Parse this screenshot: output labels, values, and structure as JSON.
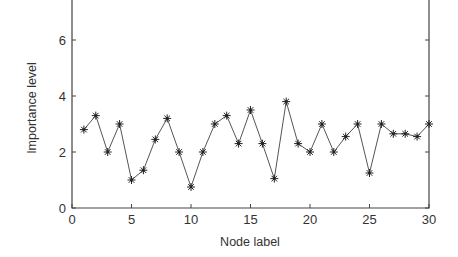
{
  "chart_data": {
    "type": "line",
    "title": "",
    "xlabel": "Node label",
    "ylabel": "Importance level",
    "xlim": [
      0,
      30
    ],
    "ylim": [
      0,
      7.4
    ],
    "xticks": [
      0,
      5,
      10,
      15,
      20,
      25,
      30
    ],
    "yticks": [
      0,
      2,
      4,
      6
    ],
    "grid": false,
    "legend": null,
    "marker": "asterisk",
    "series": [
      {
        "name": "Importance level",
        "x": [
          1,
          2,
          3,
          4,
          5,
          6,
          7,
          8,
          9,
          10,
          11,
          12,
          13,
          14,
          15,
          16,
          17,
          18,
          19,
          20,
          21,
          22,
          23,
          24,
          25,
          26,
          27,
          28,
          29,
          30
        ],
        "values": [
          2.8,
          3.3,
          2.0,
          3.0,
          1.0,
          1.35,
          2.45,
          3.2,
          2.0,
          0.75,
          2.0,
          3.0,
          3.3,
          2.3,
          3.5,
          2.3,
          1.05,
          3.8,
          2.3,
          2.0,
          3.0,
          2.0,
          2.55,
          3.0,
          1.25,
          3.0,
          2.65,
          2.65,
          2.55,
          3.0
        ]
      }
    ]
  },
  "colors": {
    "line": "#555555",
    "marker": "#222222",
    "axis": "#444444"
  }
}
